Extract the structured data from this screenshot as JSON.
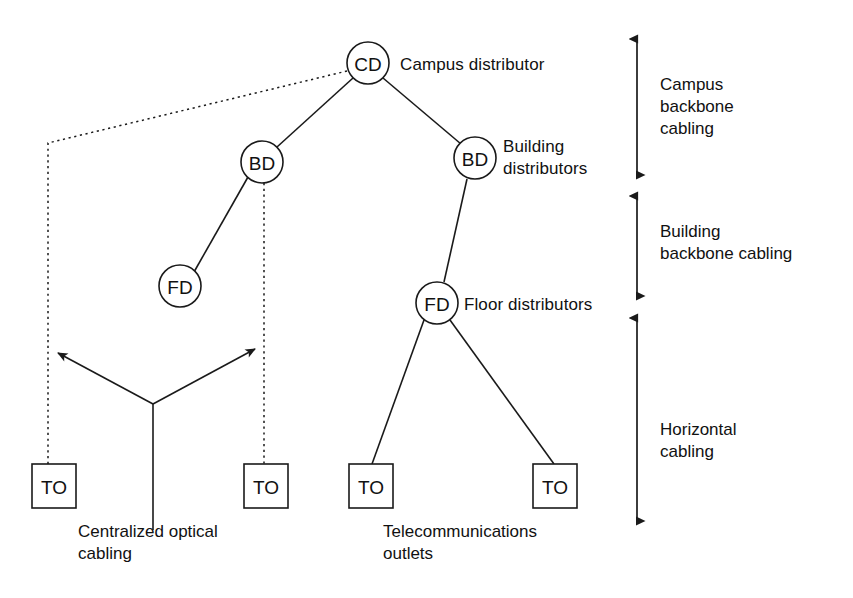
{
  "diagram": {
    "stroke_color": "#1a1a1a",
    "background_color": "#ffffff",
    "nodes": [
      {
        "id": "cd",
        "label": "CD",
        "shape": "circle",
        "cx": 368,
        "cy": 63,
        "r": 21
      },
      {
        "id": "bd_left",
        "label": "BD",
        "shape": "circle",
        "cx": 262,
        "cy": 162,
        "r": 21
      },
      {
        "id": "bd_right",
        "label": "BD",
        "shape": "circle",
        "cx": 475,
        "cy": 158,
        "r": 21
      },
      {
        "id": "fd_left",
        "label": "FD",
        "shape": "circle",
        "cx": 180,
        "cy": 286,
        "r": 21
      },
      {
        "id": "fd_right",
        "label": "FD",
        "shape": "circle",
        "cx": 437,
        "cy": 303,
        "r": 21
      },
      {
        "id": "to_1",
        "label": "TO",
        "shape": "square",
        "x": 32,
        "y": 464,
        "w": 44,
        "h": 44
      },
      {
        "id": "to_2",
        "label": "TO",
        "shape": "square",
        "x": 244,
        "y": 464,
        "w": 44,
        "h": 44
      },
      {
        "id": "to_3",
        "label": "TO",
        "shape": "square",
        "x": 349,
        "y": 464,
        "w": 44,
        "h": 44
      },
      {
        "id": "to_4",
        "label": "TO",
        "shape": "square",
        "x": 533,
        "y": 464,
        "w": 44,
        "h": 44
      }
    ],
    "node_labels": [
      {
        "id": "cd-label",
        "text": "Campus distributor",
        "x": 400,
        "y": 54
      },
      {
        "id": "bd-right-label",
        "text": "Building\ndistributors",
        "x": 503,
        "y": 137
      },
      {
        "id": "fd-right-label",
        "text": "Floor distributors",
        "x": 464,
        "y": 294
      }
    ],
    "captions": [
      {
        "id": "centralized-optical-cabling",
        "text": "Centralized optical\ncabling",
        "x": 78,
        "y": 522
      },
      {
        "id": "telecommunications-outlets",
        "text": "Telecommunications\noutlets",
        "x": 383,
        "y": 522
      }
    ],
    "scale_bars": [
      {
        "id": "campus-backbone-cabling",
        "text": "Campus\nbackbone\ncabling",
        "label_x": 660,
        "label_y": 76,
        "axis_x": 637,
        "y_top": 32,
        "y_bottom": 182
      },
      {
        "id": "building-backbone-cabling",
        "text": "Building\nbackbone cabling",
        "label_x": 660,
        "label_y": 222,
        "axis_x": 637,
        "y_top": 189,
        "y_bottom": 303
      },
      {
        "id": "horizontal-cabling",
        "text": "Horizontal\ncabling",
        "label_x": 660,
        "label_y": 420,
        "axis_x": 637,
        "y_top": 311,
        "y_bottom": 528
      }
    ],
    "edges": [
      {
        "id": "cd-to-bd-left",
        "style": "solid",
        "x1": 353,
        "y1": 78,
        "x2": 277,
        "y2": 147
      },
      {
        "id": "cd-to-bd-right",
        "style": "solid",
        "x1": 383,
        "y1": 78,
        "x2": 461,
        "y2": 144
      },
      {
        "id": "bd-left-to-fd-left",
        "style": "solid",
        "x1": 248,
        "y1": 177,
        "x2": 194,
        "y2": 272
      },
      {
        "id": "bd-right-to-fd-right",
        "style": "solid",
        "x1": 467,
        "y1": 179,
        "x2": 444,
        "y2": 282
      },
      {
        "id": "fd-right-to-to-3",
        "style": "solid",
        "x1": 424,
        "y1": 320,
        "x2": 372,
        "y2": 464
      },
      {
        "id": "fd-right-to-to-4",
        "style": "solid",
        "x1": 450,
        "y1": 320,
        "x2": 554,
        "y2": 464
      }
    ],
    "dotted_paths": [
      {
        "id": "centralized-path-to-outlet-1",
        "points": "347,71 48,143 48,464"
      },
      {
        "id": "centralized-path-to-outlet-2",
        "points": "264,183 264,464"
      }
    ],
    "optical_spur": {
      "id": "centralized-optical-spur",
      "vertex_x": 153,
      "vertex_y": 404,
      "stem_bottom_y": 530,
      "arrow_left_x": 54,
      "arrow_left_y": 355,
      "arrow_right_x": 259,
      "arrow_right_y": 347
    }
  }
}
